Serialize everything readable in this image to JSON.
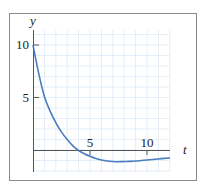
{
  "chart_data": {
    "type": "line",
    "title": "",
    "xlabel": "t",
    "ylabel": "y",
    "xlim": [
      0,
      12
    ],
    "ylim": [
      -2,
      11.5
    ],
    "x_ticks": [
      5,
      10
    ],
    "x_tick_labels": [
      "5",
      "10"
    ],
    "y_ticks": [
      5,
      10
    ],
    "y_tick_labels": [
      "5",
      "10"
    ],
    "grid": true,
    "grid_step": 1,
    "legend": "none",
    "series": [
      {
        "name": "y(t)",
        "color": "#4a7cc0",
        "x": [
          0,
          0.5,
          1,
          1.5,
          2,
          2.5,
          3,
          3.5,
          4,
          4.5,
          5,
          5.5,
          6,
          6.5,
          7,
          7.5,
          8,
          8.5,
          9,
          9.5,
          10,
          10.5,
          11,
          11.5,
          12
        ],
        "y": [
          10,
          7.3,
          5.1,
          3.7,
          2.6,
          1.7,
          1.0,
          0.4,
          -0.05,
          -0.35,
          -0.6,
          -0.8,
          -0.95,
          -1.05,
          -1.1,
          -1.12,
          -1.1,
          -1.08,
          -1.05,
          -1.0,
          -0.95,
          -0.9,
          -0.85,
          -0.8,
          -0.75
        ]
      }
    ]
  },
  "colors": {
    "frame": "#8a8a8a",
    "axis": "#555555",
    "grid": "#e4eef8",
    "curve": "#4a7cc0"
  }
}
